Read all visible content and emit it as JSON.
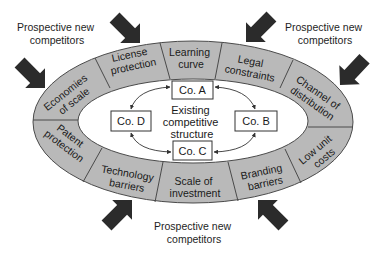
{
  "entrants": [
    {
      "line1": "Prospective new",
      "line2": "competitors"
    },
    {
      "line1": "Prospective new",
      "line2": "competitors"
    },
    {
      "line1": "Prospective new",
      "line2": "competitors"
    }
  ],
  "barriers": [
    {
      "line1": "Economies",
      "line2": "of scale"
    },
    {
      "line1": "License",
      "line2": "protection"
    },
    {
      "line1": "Learning",
      "line2": "curve"
    },
    {
      "line1": "Legal",
      "line2": "constraints"
    },
    {
      "line1": "Channel of",
      "line2": "distribution"
    },
    {
      "line1": "Patent",
      "line2": "protection"
    },
    {
      "line1": "Technology",
      "line2": "barriers"
    },
    {
      "line1": "Scale of",
      "line2": "investment"
    },
    {
      "line1": "Branding",
      "line2": "barriers"
    },
    {
      "line1": "Low unit",
      "line2": "costs"
    }
  ],
  "center": {
    "line1": "Existing",
    "line2": "competitive",
    "line3": "structure"
  },
  "companies": {
    "a": "Co. A",
    "b": "Co. B",
    "c": "Co. C",
    "d": "Co. D"
  },
  "icons": {
    "entry_arrow": "block-arrow-icon",
    "rivalry_arrow": "double-headed-curved-arrow-icon"
  },
  "colors": {
    "ring_fill": "#b9b9b9",
    "ring_stroke": "#4a4a4a",
    "entry_arrow": "#2b2b2b",
    "box_stroke": "#333333",
    "background": "#ffffff"
  }
}
